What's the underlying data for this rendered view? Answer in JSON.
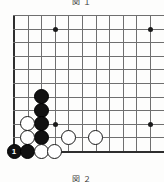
{
  "diagram": {
    "type": "go-board-diagram",
    "caption_top": "図 １",
    "caption_bottom": "図 ２",
    "board": {
      "visible_columns": 11,
      "visible_rows": 11,
      "origin_x": 14,
      "origin_y": 15,
      "spacing": 13.6,
      "line_color": "#6f6f6f",
      "edge_color": "#2e2e2e",
      "background": "#fdfdfc",
      "corner": "bottom-left"
    },
    "star_points": [
      {
        "name": "star-point-upper-left",
        "col": 3,
        "row": 1
      },
      {
        "name": "star-point-upper-right",
        "col": 10,
        "row": 1
      },
      {
        "name": "star-point-center-left",
        "col": 3,
        "row": 8
      },
      {
        "name": "star-point-center-right",
        "col": 10,
        "row": 8
      }
    ],
    "stones": [
      {
        "name": "black-stone-c2-r6",
        "color": "black",
        "col": 2,
        "row": 6,
        "label": ""
      },
      {
        "name": "black-stone-c2-r7",
        "color": "black",
        "col": 2,
        "row": 7,
        "label": ""
      },
      {
        "name": "black-stone-c2-r8",
        "color": "black",
        "col": 2,
        "row": 8,
        "label": ""
      },
      {
        "name": "black-stone-c2-r9",
        "color": "black",
        "col": 2,
        "row": 9,
        "label": ""
      },
      {
        "name": "white-stone-c1-r8",
        "color": "white",
        "col": 1,
        "row": 8,
        "label": ""
      },
      {
        "name": "white-stone-c1-r9",
        "color": "white",
        "col": 1,
        "row": 9,
        "label": ""
      },
      {
        "name": "black-stone-move-1",
        "color": "black",
        "col": 0,
        "row": 10,
        "label": "1"
      },
      {
        "name": "black-stone-c1-r10",
        "color": "black",
        "col": 1,
        "row": 10,
        "label": ""
      },
      {
        "name": "white-stone-c2-r10",
        "color": "white",
        "col": 2,
        "row": 10,
        "label": ""
      },
      {
        "name": "white-stone-c3-r10",
        "color": "white",
        "col": 3,
        "row": 10,
        "label": ""
      },
      {
        "name": "white-stone-c4-r9",
        "color": "white",
        "col": 4,
        "row": 9,
        "label": ""
      },
      {
        "name": "white-stone-c6-r9",
        "color": "white",
        "col": 6,
        "row": 9,
        "label": ""
      }
    ]
  }
}
